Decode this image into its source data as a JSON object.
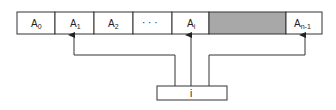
{
  "diagram": {
    "array_cells": [
      {
        "label": "A",
        "sub": "0",
        "shaded": false
      },
      {
        "label": "A",
        "sub": "1",
        "shaded": false
      },
      {
        "label": "A",
        "sub": "2",
        "shaded": false
      },
      {
        "label": "· · ·",
        "sub": "",
        "shaded": false
      },
      {
        "label": "A",
        "sub": "i",
        "shaded": false
      },
      {
        "label": "",
        "sub": "",
        "shaded": true
      },
      {
        "label": "A",
        "sub": "n-1",
        "shaded": false
      }
    ],
    "index_box_label": "i",
    "pointer_targets": [
      "A1",
      "Ai",
      "An-1"
    ],
    "colors": {
      "line": "#333333",
      "shaded_cell": "#a8a8a8",
      "cell_fill": "#ffffff"
    }
  }
}
